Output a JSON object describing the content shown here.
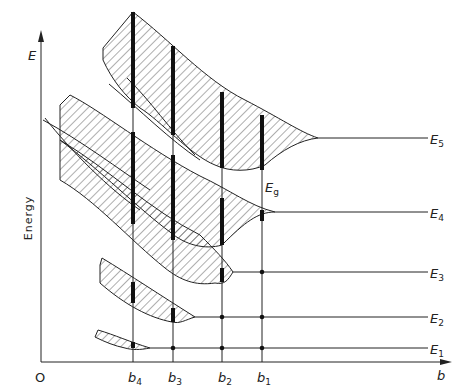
{
  "diagram": {
    "type": "energy-band-diagram",
    "y_axis": {
      "symbol": "E",
      "label": "Energy"
    },
    "x_axis": {
      "symbol": "b",
      "origin": "O"
    },
    "levels": [
      {
        "name": "E",
        "sub": "1"
      },
      {
        "name": "E",
        "sub": "2"
      },
      {
        "name": "E",
        "sub": "3"
      },
      {
        "name": "E",
        "sub": "4"
      },
      {
        "name": "E",
        "sub": "5"
      }
    ],
    "spacings": [
      {
        "name": "b",
        "sub": "4"
      },
      {
        "name": "b",
        "sub": "3"
      },
      {
        "name": "b",
        "sub": "2"
      },
      {
        "name": "b",
        "sub": "1"
      }
    ],
    "gap_label": {
      "name": "E",
      "sub": "g"
    }
  },
  "colors": {
    "line": "#222222",
    "background": "#ffffff"
  }
}
